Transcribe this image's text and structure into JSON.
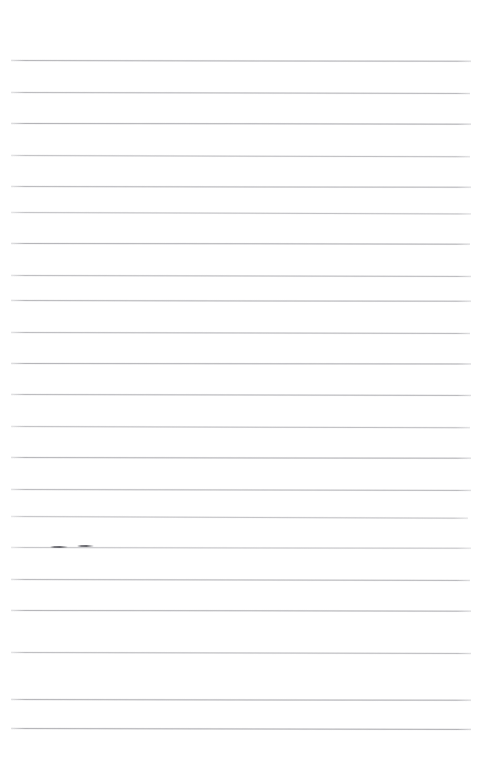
{
  "document": {
    "kind": "lined-paper-scan",
    "title": "Blank ruled notebook page",
    "page_width": 483,
    "page_height": 765,
    "background_color": "#ffffff",
    "rule_color": "#a9a9ad",
    "mark_color": "#606066",
    "text_content": "",
    "has_handwriting": false,
    "notes": "Empty scanned sheet of ruled paper; no printed or handwritten text is present."
  },
  "ruling": {
    "line_count": 22,
    "left_margin_x": 11,
    "right_margin_x": 471,
    "first_line_y": 60,
    "line_spacing": 31.2,
    "thickness": 1,
    "lines": [
      {
        "y": 60,
        "x1": 11,
        "x2": 471,
        "tilt_deg": 0.1,
        "opacity": 0.85
      },
      {
        "y": 92,
        "x1": 11,
        "x2": 470,
        "tilt_deg": 0.14,
        "opacity": 0.8
      },
      {
        "y": 123,
        "x1": 11,
        "x2": 471,
        "tilt_deg": 0.08,
        "opacity": 0.88
      },
      {
        "y": 155,
        "x1": 11,
        "x2": 470,
        "tilt_deg": 0.16,
        "opacity": 0.72
      },
      {
        "y": 186,
        "x1": 11,
        "x2": 471,
        "tilt_deg": 0.1,
        "opacity": 0.8
      },
      {
        "y": 212,
        "x1": 11,
        "x2": 471,
        "tilt_deg": 0.18,
        "opacity": 0.7
      },
      {
        "y": 243,
        "x1": 11,
        "x2": 470,
        "tilt_deg": 0.08,
        "opacity": 0.86
      },
      {
        "y": 275,
        "x1": 11,
        "x2": 471,
        "tilt_deg": 0.12,
        "opacity": 0.76
      },
      {
        "y": 300,
        "x1": 11,
        "x2": 471,
        "tilt_deg": 0.09,
        "opacity": 0.82
      },
      {
        "y": 332,
        "x1": 11,
        "x2": 470,
        "tilt_deg": 0.13,
        "opacity": 0.78
      },
      {
        "y": 363,
        "x1": 11,
        "x2": 471,
        "tilt_deg": 0.07,
        "opacity": 0.86
      },
      {
        "y": 394,
        "x1": 11,
        "x2": 471,
        "tilt_deg": 0.12,
        "opacity": 0.8
      },
      {
        "y": 426,
        "x1": 11,
        "x2": 470,
        "tilt_deg": 0.15,
        "opacity": 0.72
      },
      {
        "y": 457,
        "x1": 11,
        "x2": 471,
        "tilt_deg": 0.09,
        "opacity": 0.84
      },
      {
        "y": 489,
        "x1": 11,
        "x2": 471,
        "tilt_deg": 0.11,
        "opacity": 0.78
      },
      {
        "y": 516,
        "x1": 11,
        "x2": 468,
        "tilt_deg": 0.22,
        "opacity": 0.68
      },
      {
        "y": 547,
        "x1": 11,
        "x2": 471,
        "tilt_deg": 0.1,
        "opacity": 0.66
      },
      {
        "y": 579,
        "x1": 11,
        "x2": 470,
        "tilt_deg": 0.12,
        "opacity": 0.8
      },
      {
        "y": 610,
        "x1": 11,
        "x2": 471,
        "tilt_deg": 0.08,
        "opacity": 0.84
      },
      {
        "y": 652,
        "x1": 11,
        "x2": 471,
        "tilt_deg": 0.14,
        "opacity": 0.76
      },
      {
        "y": 699,
        "x1": 11,
        "x2": 471,
        "tilt_deg": 0.09,
        "opacity": 0.86
      },
      {
        "y": 728,
        "x1": 11,
        "x2": 471,
        "tilt_deg": 0.11,
        "opacity": 0.88
      }
    ]
  },
  "marks": [
    {
      "label": "pencil-dash-left",
      "x": 50,
      "y": 546,
      "width": 18,
      "height": 2
    },
    {
      "label": "pencil-dash-right",
      "x": 77,
      "y": 545,
      "width": 17,
      "height": 2
    }
  ]
}
